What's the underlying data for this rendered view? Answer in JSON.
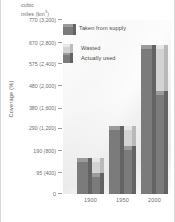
{
  "chart": {
    "type": "bar",
    "unit_header_line1": "cubic",
    "unit_header_line2": "miles (km",
    "unit_header_sup": "3",
    "unit_header_close": ")",
    "axis_title": "Coverage (%)",
    "legend": {
      "taken_label": "Taken from supply",
      "wasted_label": "Wasted",
      "used_label": "Actually used"
    },
    "y_ticks": [
      {
        "label": "770 (3,200)",
        "value": 770
      },
      {
        "label": "670 (2,800)",
        "value": 670
      },
      {
        "label": "575 (2,400)",
        "value": 575
      },
      {
        "label": "480 (2,000)",
        "value": 480
      },
      {
        "label": "380 (1,600)",
        "value": 380
      },
      {
        "label": "290 (1,200)",
        "value": 290
      },
      {
        "label": "190 (800)",
        "value": 190
      },
      {
        "label": "95 (400)",
        "value": 95
      },
      {
        "label": "0",
        "value": 0
      }
    ],
    "x_labels": [
      "1900",
      "1950",
      "2000"
    ]
  },
  "chart_data": {
    "type": "bar",
    "title": "",
    "subtitle": "",
    "xlabel": "",
    "ylabel": "Coverage (%)",
    "y_unit_header": "cubic miles (km³)",
    "categories": [
      "1900",
      "1950",
      "2000"
    ],
    "ylim": [
      0,
      770
    ],
    "ytick_values": [
      0,
      95,
      190,
      290,
      380,
      480,
      575,
      670,
      770
    ],
    "ytick_labels": [
      "0",
      "95 (400)",
      "190 (800)",
      "290 (1,200)",
      "380 (1,600)",
      "480 (2,000)",
      "575 (2,400)",
      "670 (2,800)",
      "770 (3,200)"
    ],
    "grid": true,
    "legend_position": "upper-left-inside",
    "series": [
      {
        "name": "Taken from supply",
        "color": "#7b7b7b",
        "values": [
          140,
          285,
          640
        ]
      },
      {
        "name": "Wasted",
        "color": "#d3d3d3",
        "values": [
          140,
          285,
          640
        ]
      },
      {
        "name": "Actually used",
        "color": "#7b7b7b",
        "values": [
          75,
          195,
          440
        ]
      }
    ],
    "annotations": [
      "Left bar of each pair = Taken from supply (dark)",
      "Right bar of each pair = total Wasted (light) with Actually used (dark) portion from baseline"
    ]
  }
}
